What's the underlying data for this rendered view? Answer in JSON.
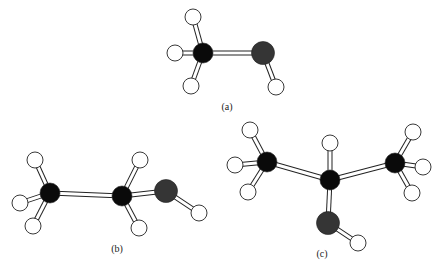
{
  "figure": {
    "background": "#ffffff",
    "colors": {
      "carbon": "#0a0a0a",
      "oxygen": "#353535",
      "hydrogen": "#ffffff",
      "outline": "#222222"
    },
    "molecules": [
      {
        "id": "a",
        "label": "(a)",
        "name": "methanol",
        "label_pos": [
          227,
          106
        ],
        "atoms": [
          {
            "el": "H",
            "x": 193,
            "y": 17
          },
          {
            "el": "H",
            "x": 175,
            "y": 53
          },
          {
            "el": "C",
            "x": 203,
            "y": 53
          },
          {
            "el": "O",
            "x": 263,
            "y": 53
          },
          {
            "el": "H",
            "x": 191,
            "y": 86
          },
          {
            "el": "H",
            "x": 276,
            "y": 87
          }
        ],
        "bonds": [
          [
            0,
            2
          ],
          [
            1,
            2
          ],
          [
            4,
            2
          ],
          [
            2,
            3
          ],
          [
            3,
            5
          ]
        ]
      },
      {
        "id": "b",
        "label": "(b)",
        "name": "ethanol",
        "label_pos": [
          117,
          248
        ],
        "atoms": [
          {
            "el": "H",
            "x": 35,
            "y": 160
          },
          {
            "el": "H",
            "x": 20,
            "y": 203
          },
          {
            "el": "H",
            "x": 33,
            "y": 226
          },
          {
            "el": "C",
            "x": 50,
            "y": 193
          },
          {
            "el": "H",
            "x": 140,
            "y": 160
          },
          {
            "el": "H",
            "x": 139,
            "y": 228
          },
          {
            "el": "C",
            "x": 122,
            "y": 196
          },
          {
            "el": "O",
            "x": 166,
            "y": 191
          },
          {
            "el": "H",
            "x": 199,
            "y": 213
          }
        ],
        "bonds": [
          [
            0,
            3
          ],
          [
            1,
            3
          ],
          [
            2,
            3
          ],
          [
            3,
            6
          ],
          [
            4,
            6
          ],
          [
            5,
            6
          ],
          [
            6,
            7
          ],
          [
            7,
            8
          ]
        ]
      },
      {
        "id": "c",
        "label": "(c)",
        "name": "isopropanol",
        "label_pos": [
          322,
          253
        ],
        "atoms": [
          {
            "el": "H",
            "x": 250,
            "y": 130
          },
          {
            "el": "H",
            "x": 235,
            "y": 165
          },
          {
            "el": "H",
            "x": 248,
            "y": 192
          },
          {
            "el": "C",
            "x": 267,
            "y": 162
          },
          {
            "el": "H",
            "x": 330,
            "y": 143
          },
          {
            "el": "C",
            "x": 330,
            "y": 180
          },
          {
            "el": "H",
            "x": 413,
            "y": 132
          },
          {
            "el": "H",
            "x": 423,
            "y": 167
          },
          {
            "el": "H",
            "x": 412,
            "y": 193
          },
          {
            "el": "C",
            "x": 395,
            "y": 163
          },
          {
            "el": "O",
            "x": 328,
            "y": 223
          },
          {
            "el": "H",
            "x": 358,
            "y": 243
          }
        ],
        "bonds": [
          [
            0,
            3
          ],
          [
            1,
            3
          ],
          [
            2,
            3
          ],
          [
            3,
            5
          ],
          [
            4,
            5
          ],
          [
            5,
            9
          ],
          [
            6,
            9
          ],
          [
            7,
            9
          ],
          [
            8,
            9
          ],
          [
            5,
            10
          ],
          [
            10,
            11
          ]
        ]
      }
    ],
    "radii": {
      "C": 10,
      "O": 11.5,
      "H": 8
    }
  }
}
